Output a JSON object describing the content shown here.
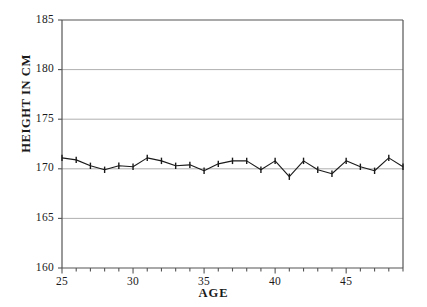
{
  "chart_data": {
    "type": "line",
    "title": "",
    "xlabel": "AGE",
    "ylabel": "HEIGHT IN CM",
    "xlim": [
      25,
      49
    ],
    "ylim": [
      160,
      185
    ],
    "ytick_labels": [
      "185",
      "180",
      "175",
      "170",
      "165",
      "160"
    ],
    "ytick_values": [
      185,
      180,
      175,
      170,
      165,
      160
    ],
    "xtick_labels": [
      "25",
      "30",
      "35",
      "40",
      "45"
    ],
    "xtick_values": [
      25,
      30,
      35,
      40,
      45
    ],
    "x_minor_tick_step": 1,
    "grid": "horizontal-gridlines-at-major-yticks",
    "legend": "none",
    "marker": "vertical-tick",
    "line_color": "#1a1a1a",
    "grid_color": "#9a9a9a",
    "axis_color": "#555555",
    "x": [
      25,
      26,
      27,
      28,
      29,
      30,
      31,
      32,
      33,
      34,
      35,
      36,
      37,
      38,
      39,
      40,
      41,
      42,
      43,
      44,
      45,
      46,
      47,
      48,
      49
    ],
    "values": [
      171.1,
      170.9,
      170.3,
      169.9,
      170.3,
      170.2,
      171.1,
      170.8,
      170.3,
      170.4,
      169.8,
      170.5,
      170.8,
      170.8,
      169.9,
      170.8,
      169.2,
      170.8,
      169.9,
      169.5,
      170.8,
      170.2,
      169.8,
      171.1,
      170.2
    ],
    "series_name": "Mean height by age"
  },
  "axis_titles": {
    "y": "HEIGHT IN CM",
    "x": "AGE"
  }
}
